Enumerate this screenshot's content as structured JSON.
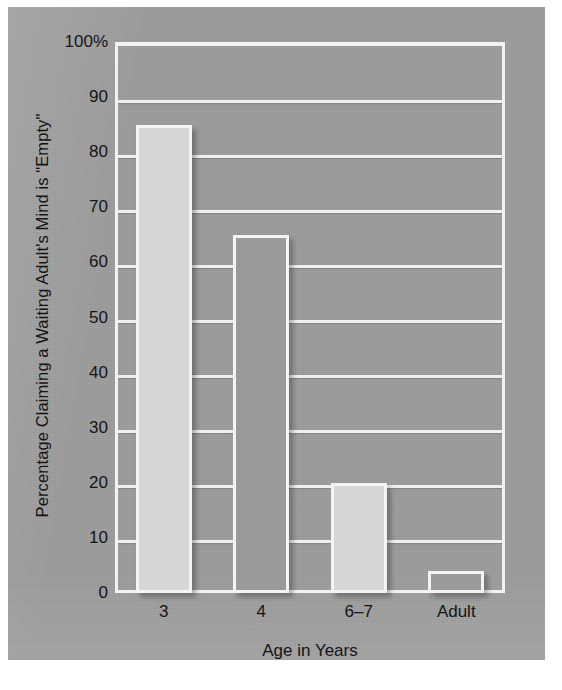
{
  "chart_data": {
    "type": "bar",
    "title": "",
    "subtitle": "",
    "xlabel": "Age in Years",
    "ylabel": "Percentage Claiming a Waiting Adult's Mind is \"Empty\"",
    "categories": [
      "3",
      "4",
      "6–7",
      "Adult"
    ],
    "values": [
      85,
      65,
      20,
      4
    ],
    "ylim": [
      0,
      100
    ],
    "ytick_values": [
      0,
      10,
      20,
      30,
      40,
      50,
      60,
      70,
      80,
      90,
      100
    ],
    "ytick_labels": [
      "0",
      "10",
      "20",
      "30",
      "40",
      "50",
      "60",
      "70",
      "80",
      "90",
      "100%"
    ],
    "grid": true,
    "grid_axis": "y",
    "legend": false,
    "legend_position": "none",
    "bar_styles": [
      "light",
      "dark",
      "light",
      "dark"
    ],
    "series": [
      {
        "name": "Percentage",
        "values": [
          85,
          65,
          20,
          4
        ]
      }
    ],
    "colors": {
      "panel_background": "#9c9c9c",
      "gridline": "#f0f0f0",
      "frame": "#f2f2f2",
      "bar_light_fill": "#d7d7d7",
      "bar_dark_fill": "#9a9a9a",
      "bar_outline": "#f4f4f4",
      "text": "#151515",
      "page_background": "#ffffff"
    }
  },
  "axes": {
    "y_title": "Percentage Claiming a Waiting Adult's Mind is \"Empty\"",
    "x_title": "Age in Years"
  }
}
